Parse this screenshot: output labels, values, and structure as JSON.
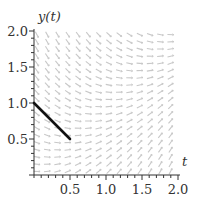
{
  "chart_data": {
    "type": "direction-field",
    "title": "",
    "xlabel": "t",
    "ylabel": "y(t)",
    "equation_hint": "dy/dt = t - y",
    "xlim": [
      0,
      2.0
    ],
    "ylim": [
      0,
      2.0
    ],
    "x_ticks": [
      {
        "value": 0.5,
        "label": "0.5"
      },
      {
        "value": 1.0,
        "label": "1.0"
      },
      {
        "value": 1.5,
        "label": "1.5"
      },
      {
        "value": 2.0,
        "label": "2.0"
      }
    ],
    "y_ticks": [
      {
        "value": 0.5,
        "label": "0.5"
      },
      {
        "value": 1.0,
        "label": "1.0"
      },
      {
        "value": 1.5,
        "label": "1.5"
      },
      {
        "value": 2.0,
        "label": "2.0"
      }
    ],
    "minor_tick_step": 0.1,
    "field": {
      "t_count": 14,
      "y_count": 20,
      "color": "#c8c8c8"
    },
    "series": [
      {
        "name": "euler-step",
        "x": [
          0,
          0.5
        ],
        "y": [
          1.0,
          0.5
        ],
        "color": "#111111"
      }
    ],
    "grid": false,
    "legend": "none"
  },
  "colors": {
    "axis": "#333333",
    "field": "#c8c8c8",
    "solution": "#111111"
  }
}
